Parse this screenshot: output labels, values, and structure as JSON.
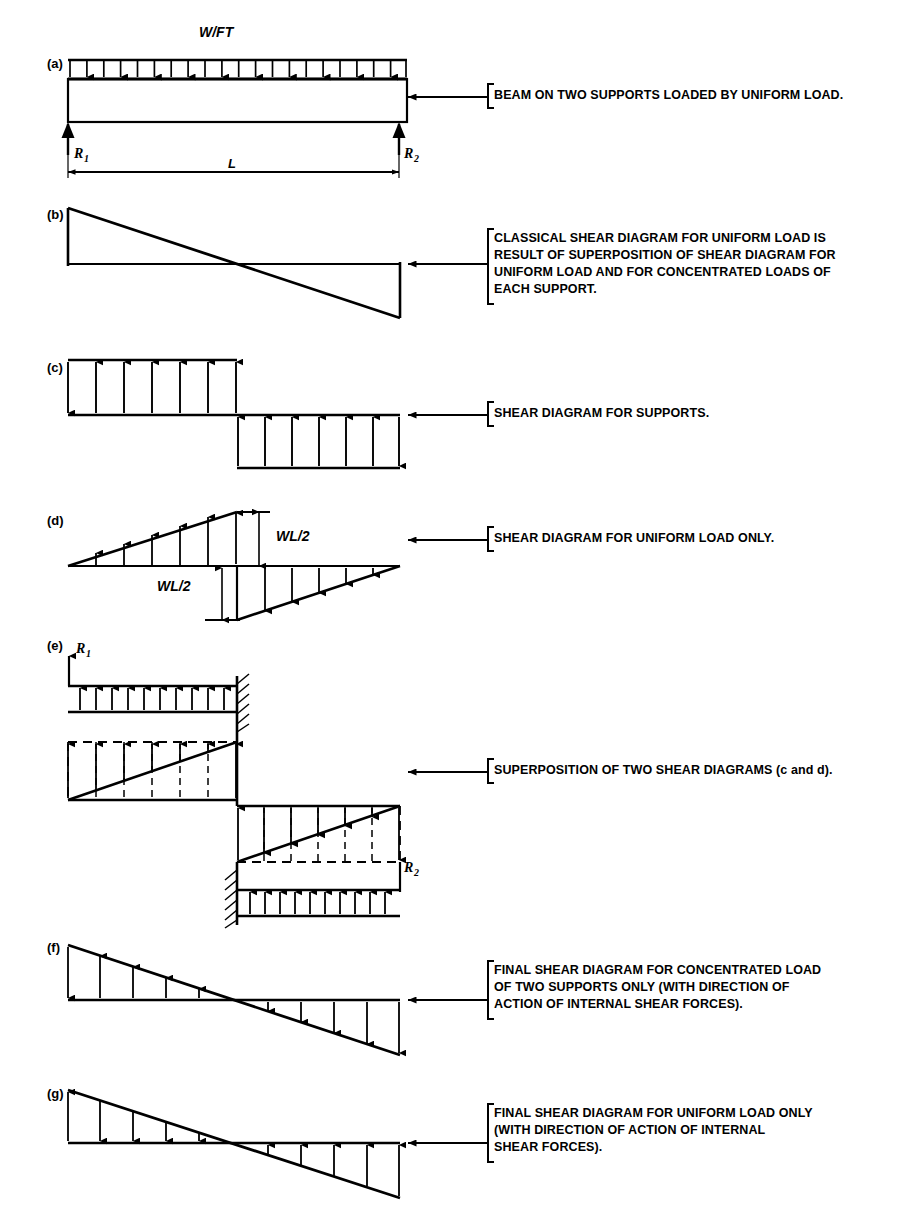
{
  "figure": {
    "background_color": "#ffffff",
    "ink_color": "#000000"
  },
  "panels": [
    {
      "id": "a",
      "letter": "(a)",
      "load_label": "W/FT",
      "reaction_left": "R",
      "reaction_left_sub": "1",
      "reaction_right": "R",
      "reaction_right_sub": "2",
      "span_label": "L",
      "caption": "BEAM ON TWO SUPPORTS LOADED BY UNIFORM LOAD."
    },
    {
      "id": "b",
      "letter": "(b)",
      "caption": "CLASSICAL SHEAR DIAGRAM FOR UNIFORM LOAD IS\nRESULT OF SUPERPOSITION OF SHEAR DIAGRAM FOR\nUNIFORM LOAD AND FOR CONCENTRATED LOADS OF\nEACH SUPPORT."
    },
    {
      "id": "c",
      "letter": "(c)",
      "caption": "SHEAR DIAGRAM FOR SUPPORTS."
    },
    {
      "id": "d",
      "letter": "(d)",
      "label_upper": "WL/2",
      "label_lower": "WL/2",
      "caption": "SHEAR DIAGRAM FOR UNIFORM LOAD ONLY."
    },
    {
      "id": "e",
      "letter": "(e)",
      "reaction_left": "R",
      "reaction_left_sub": "1",
      "reaction_right": "R",
      "reaction_right_sub": "2",
      "caption": "SUPERPOSITION OF TWO SHEAR DIAGRAMS (c and d)."
    },
    {
      "id": "f",
      "letter": "(f)",
      "caption": "FINAL SHEAR DIAGRAM FOR CONCENTRATED LOAD\nOF TWO SUPPORTS ONLY (WITH DIRECTION OF\nACTION OF INTERNAL SHEAR FORCES)."
    },
    {
      "id": "g",
      "letter": "(g)",
      "caption": "FINAL SHEAR DIAGRAM FOR UNIFORM LOAD ONLY\n(WITH DIRECTION OF ACTION OF INTERNAL\nSHEAR FORCES)."
    }
  ]
}
